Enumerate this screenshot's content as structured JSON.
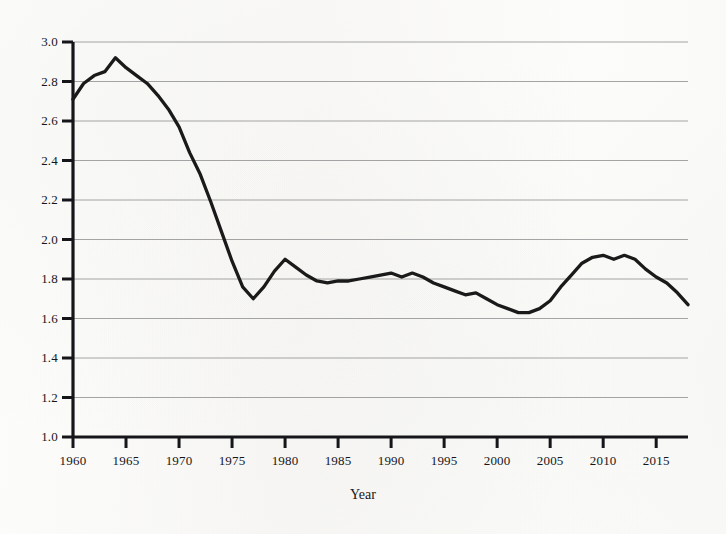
{
  "chart_data": {
    "type": "line",
    "title": "",
    "xlabel": "Year",
    "ylabel": "",
    "xlim": [
      1960,
      2018
    ],
    "ylim": [
      1.0,
      3.0
    ],
    "grid": true,
    "legend": false,
    "line_color": "#1a1a1a",
    "background_color": "#fbfbf9",
    "gridline_color": "#9a9a9a",
    "ytick_labels": [
      "3.0",
      "2.8",
      "2.6",
      "2.4",
      "2.2",
      "2.0",
      "1.8",
      "1.6",
      "1.4",
      "1.2",
      "1.0"
    ],
    "ytick_values": [
      3.0,
      2.8,
      2.6,
      2.4,
      2.2,
      2.0,
      1.8,
      1.6,
      1.4,
      1.2,
      1.0
    ],
    "xtick_labels": [
      "1960",
      "1965",
      "1970",
      "1975",
      "1980",
      "1985",
      "1990",
      "1995",
      "2000",
      "2005",
      "2010",
      "2015"
    ],
    "xtick_values": [
      1960,
      1965,
      1970,
      1975,
      1980,
      1985,
      1990,
      1995,
      2000,
      2005,
      2010,
      2015
    ],
    "x": [
      1960,
      1961,
      1962,
      1963,
      1964,
      1965,
      1966,
      1967,
      1968,
      1969,
      1970,
      1971,
      1972,
      1973,
      1974,
      1975,
      1976,
      1977,
      1978,
      1979,
      1980,
      1981,
      1982,
      1983,
      1984,
      1985,
      1986,
      1987,
      1988,
      1989,
      1990,
      1991,
      1992,
      1993,
      1994,
      1995,
      1996,
      1997,
      1998,
      1999,
      2000,
      2001,
      2002,
      2003,
      2004,
      2005,
      2006,
      2007,
      2008,
      2009,
      2010,
      2011,
      2012,
      2013,
      2014,
      2015,
      2016,
      2017,
      2018
    ],
    "values": [
      2.71,
      2.79,
      2.83,
      2.85,
      2.92,
      2.87,
      2.83,
      2.79,
      2.73,
      2.66,
      2.57,
      2.44,
      2.33,
      2.19,
      2.04,
      1.89,
      1.76,
      1.7,
      1.76,
      1.84,
      1.9,
      1.86,
      1.82,
      1.79,
      1.78,
      1.79,
      1.79,
      1.8,
      1.81,
      1.82,
      1.83,
      1.81,
      1.83,
      1.81,
      1.78,
      1.76,
      1.74,
      1.72,
      1.73,
      1.7,
      1.67,
      1.65,
      1.63,
      1.63,
      1.65,
      1.69,
      1.76,
      1.82,
      1.88,
      1.91,
      1.92,
      1.9,
      1.92,
      1.9,
      1.85,
      1.81,
      1.78,
      1.73,
      1.67
    ]
  }
}
